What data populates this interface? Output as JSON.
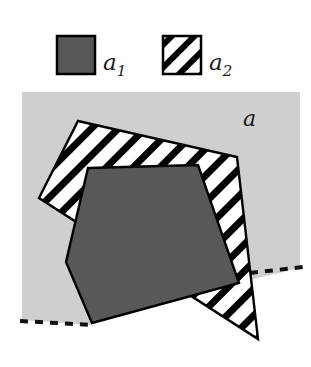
{
  "figure": {
    "legend": {
      "items": [
        {
          "key": "a1",
          "label": "a",
          "subscript": "1",
          "swatch": "solid-gray-swatch",
          "fill": "#585858"
        },
        {
          "key": "a2",
          "label": "a",
          "subscript": "2",
          "swatch": "diagonal-hatch-swatch",
          "fill": "#ffffff"
        }
      ]
    },
    "region_label": "a",
    "colors": {
      "background_region": "#cfcfcf",
      "solid_fill": "#585858",
      "hatch_stroke": "#000000",
      "hatch_background": "#ffffff",
      "outline": "#000000",
      "page": "#ffffff"
    },
    "geometry": {
      "background_region_points": "22,92 300,92 300,268 262,277 88,325 22,320",
      "dashed_boundary_left": "22,320 90,324",
      "dashed_boundary_right": "252,272 300,267",
      "outer_quad_points": "78,121 237,157 258,339 39,198",
      "inner_polygon_points": "88,168 198,165 239,283 92,323 66,262",
      "hatch_angle_deg": 45,
      "hatch_spacing_px": 19,
      "hatch_stroke_width_px": 7
    }
  }
}
